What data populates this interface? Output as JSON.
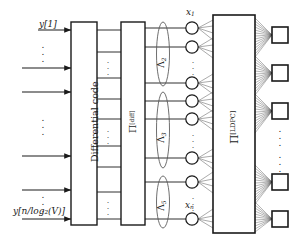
{
  "figure": {
    "type": "block-diagram"
  },
  "inputs": {
    "top_label": "y[1]",
    "bottom_label": "y[n/log₂(V)]",
    "arrow_count": 6,
    "ellipsis": "⋮"
  },
  "blocks": [
    {
      "id": "differential-code",
      "label": "Differential code",
      "label_plain": "Differential code"
    },
    {
      "id": "pi-diff",
      "label_base": "Π",
      "label_sup": "[diff]"
    },
    {
      "id": "pi-ldpc",
      "label_base": "Π",
      "label_sup": "[LDPC]"
    }
  ],
  "lambda_groups": [
    {
      "id": "lambda-2",
      "base": "Λ",
      "sub": "2"
    },
    {
      "id": "lambda-3",
      "base": "Λ",
      "sub": "3"
    },
    {
      "id": "lambda-5",
      "base": "Λ",
      "sub": "5"
    }
  ],
  "variable_nodes": {
    "first_label_base": "x",
    "first_label_sub": "1",
    "last_label_base": "x",
    "last_label_sub": "n",
    "count": 8
  },
  "check_nodes": {
    "count": 5,
    "shape": "square",
    "ellipsis": "⋮"
  },
  "colors": {
    "stroke": "#1a1a1a",
    "fill": "#ffffff",
    "edge": "#3a3a3a",
    "background": "#ffffff"
  }
}
